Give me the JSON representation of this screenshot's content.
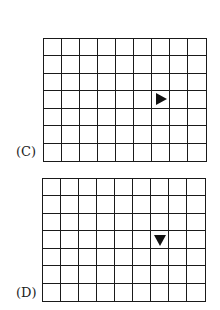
{
  "panels": [
    {
      "label": "(C)",
      "rows": 7,
      "cols": 9,
      "marker": {
        "row": 3,
        "col": 6,
        "direction": "right",
        "icon": "right-triangle-icon"
      },
      "box": {
        "left": 43,
        "top": 38,
        "width": 164,
        "height": 124
      },
      "label_pos": {
        "left": 16,
        "top": 144
      }
    },
    {
      "label": "(D)",
      "rows": 7,
      "cols": 9,
      "marker": {
        "row": 3,
        "col": 6,
        "direction": "down",
        "icon": "down-triangle-icon"
      },
      "box": {
        "left": 42,
        "top": 178,
        "width": 164,
        "height": 124
      },
      "label_pos": {
        "left": 16,
        "top": 285
      }
    }
  ],
  "colors": {
    "line": "#1a1a1a",
    "marker": "#111111",
    "background": "#ffffff"
  }
}
